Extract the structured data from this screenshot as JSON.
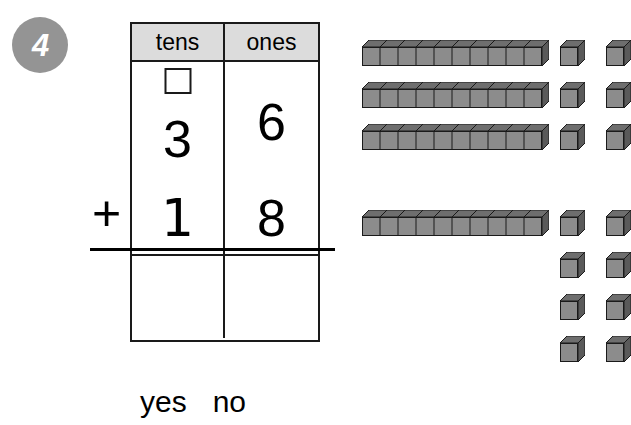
{
  "problem": {
    "number": "4",
    "operation": "+",
    "addend_top": {
      "tens": "3",
      "ones": "6",
      "value": 36
    },
    "addend_bottom": {
      "tens": "1",
      "ones": "8",
      "value": 18
    },
    "sum": {
      "tens": "",
      "ones": ""
    },
    "regroup_box_value": ""
  },
  "table": {
    "headers": {
      "tens": "tens",
      "ones": "ones"
    }
  },
  "answer_choices": [
    {
      "label": "yes"
    },
    {
      "label": "no"
    }
  ],
  "manipulatives": {
    "top_group": {
      "rods": 3,
      "rod_segments": 10,
      "ones_rows": 3,
      "ones_per_row": 2,
      "ones_total": 6,
      "represents": 36
    },
    "bottom_group": {
      "rods": 1,
      "rod_segments": 10,
      "ones_rows": 4,
      "ones_per_row": 2,
      "ones_total": 8,
      "represents": 18
    }
  },
  "colors": {
    "badge_gray": "#949494",
    "header_fill": "#dcdcdc",
    "block_face": "#8c8c8c",
    "block_top": "#6e6e6e",
    "block_side": "#5a5a5a",
    "outline": "#1a1a1a",
    "background": "#ffffff"
  }
}
